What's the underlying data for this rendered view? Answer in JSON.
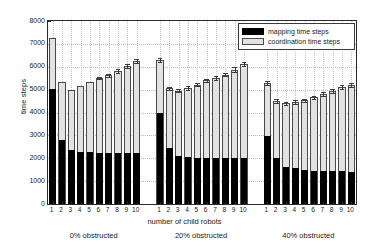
{
  "chart_data": {
    "type": "bar",
    "title": "",
    "subtitle": "",
    "xlabel": "number of child robots",
    "ylabel": "time steps",
    "ylim": [
      0,
      8000
    ],
    "ytick_values": [
      0,
      1000,
      2000,
      3000,
      4000,
      5000,
      6000,
      7000,
      8000
    ],
    "ytick_labels": [
      "0",
      "1000",
      "2000",
      "3000",
      "4000",
      "5000",
      "6000",
      "7000",
      "8000"
    ],
    "grid": true,
    "stacked": true,
    "legend_position": "top-right",
    "legend": [
      "mapping time steps",
      "coordination time steps"
    ],
    "colors": {
      "mapping": "#000000",
      "coordination": "#e2e2e2",
      "edge": "#4a4a4a",
      "axis": "#2a2a2a",
      "grid": "#bdbdbd"
    },
    "categories": [
      "1",
      "2",
      "3",
      "4",
      "5",
      "6",
      "7",
      "8",
      "9",
      "10"
    ],
    "groups": [
      {
        "name": "0% obstructed",
        "caption": "0% obstructed",
        "series": [
          {
            "name": "mapping time steps",
            "values": [
              5000,
              2800,
              2350,
              2250,
              2250,
              2220,
              2200,
              2200,
              2200,
              2200
            ]
          },
          {
            "name": "coordination time steps",
            "values": [
              2260,
              2550,
              2630,
              2920,
              3080,
              3290,
              3420,
              3600,
              3850,
              4040
            ]
          }
        ],
        "totals": [
          7260,
          5350,
          4980,
          5170,
          5330,
          5510,
          5620,
          5800,
          6050,
          6240
        ],
        "errors": [
          0,
          0,
          0,
          0,
          0,
          60,
          70,
          80,
          90,
          95
        ]
      },
      {
        "name": "20% obstructed",
        "caption": "20% obstructed",
        "series": [
          {
            "name": "mapping time steps",
            "values": [
              3980,
              2450,
              2100,
              2050,
              2000,
              1990,
              1980,
              1980,
              1980,
              1980
            ]
          },
          {
            "name": "coordination time steps",
            "values": [
              2320,
              2610,
              2850,
              3020,
              3210,
              3410,
              3520,
              3680,
              3900,
              4150
            ]
          }
        ],
        "totals": [
          6300,
          5060,
          4950,
          5070,
          5210,
          5400,
          5500,
          5660,
          5880,
          6130
        ],
        "errors": [
          80,
          70,
          70,
          70,
          70,
          75,
          80,
          85,
          90,
          95
        ]
      },
      {
        "name": "40% obstructed",
        "caption": "40% obstructed",
        "series": [
          {
            "name": "mapping time steps",
            "values": [
              2950,
              1980,
              1600,
              1560,
              1480,
              1440,
              1430,
              1420,
              1420,
              1400
            ]
          },
          {
            "name": "coordination time steps",
            "values": [
              2340,
              2520,
              2800,
              2900,
              3060,
              3220,
              3370,
              3530,
              3680,
              3800
            ]
          }
        ],
        "totals": [
          5290,
          4500,
          4400,
          4460,
          4540,
          4660,
          4800,
          4950,
          5100,
          5200
        ],
        "errors": [
          75,
          70,
          70,
          70,
          70,
          75,
          80,
          85,
          90,
          95
        ]
      }
    ]
  }
}
